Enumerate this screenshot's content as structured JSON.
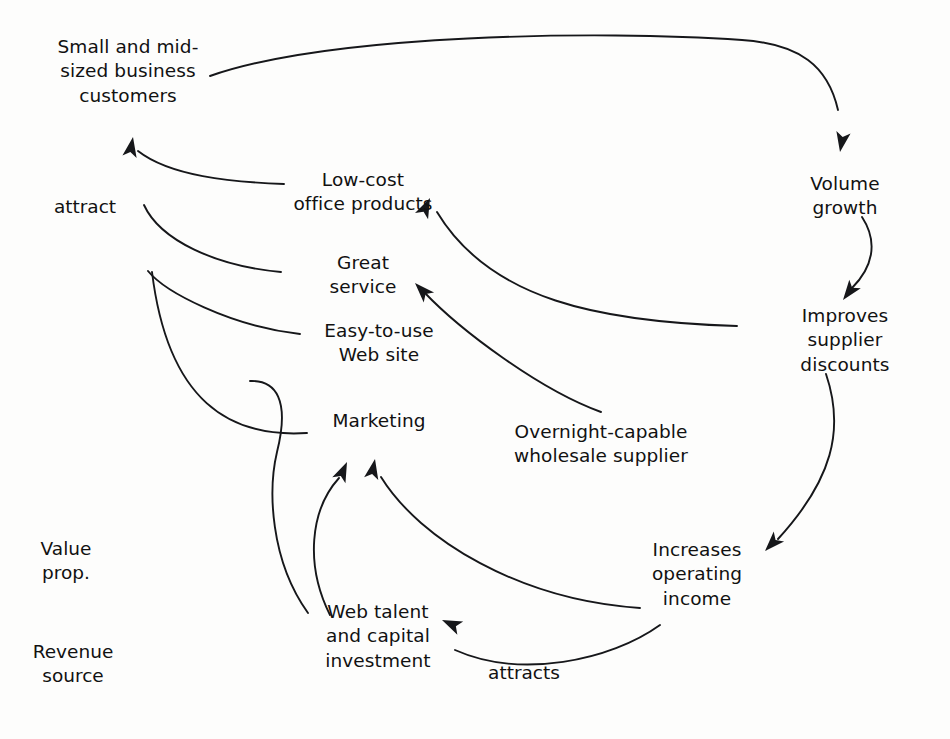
{
  "diagram": {
    "stroke_color": "#16171a",
    "text_color": "#111111",
    "background": "#fdfdfc",
    "nodes": [
      {
        "id": "customers",
        "label": "Small and mid-\nsized business\ncustomers",
        "x": 128,
        "y": 72
      },
      {
        "id": "low-cost-office-products",
        "label": "Low-cost\noffice products",
        "x": 363,
        "y": 192
      },
      {
        "id": "great-service",
        "label": "Great\nservice",
        "x": 363,
        "y": 275
      },
      {
        "id": "easy-to-use-web-site",
        "label": "Easy-to-use\nWeb site",
        "x": 379,
        "y": 343
      },
      {
        "id": "marketing",
        "label": "Marketing",
        "x": 379,
        "y": 421
      },
      {
        "id": "overnight-wholesale-supplier",
        "label": "Overnight-capable\nwholesale supplier",
        "x": 601,
        "y": 444
      },
      {
        "id": "web-talent-capital",
        "label": "Web talent\nand capital\ninvestment",
        "x": 378,
        "y": 637
      },
      {
        "id": "volume-growth",
        "label": "Volume growth",
        "x": 845,
        "y": 196
      },
      {
        "id": "improves-supplier-discounts",
        "label": "Improves\nsupplier discounts",
        "x": 845,
        "y": 341
      },
      {
        "id": "increases-operating-income",
        "label": "Increases\noperating\nincome",
        "x": 697,
        "y": 575
      }
    ],
    "edge_labels": [
      {
        "id": "attract",
        "label": "attract",
        "x": 85,
        "y": 207
      },
      {
        "id": "attracts",
        "label": "attracts",
        "x": 524,
        "y": 673
      }
    ],
    "column_labels": [
      {
        "id": "value-prop",
        "label": "Value\nprop.",
        "x": 66,
        "y": 561
      },
      {
        "id": "revenue-source",
        "label": "Revenue\nsource",
        "x": 73,
        "y": 664
      }
    ],
    "edges": [
      {
        "id": "customers-to-volume-growth",
        "from": "customers",
        "to": "volume-growth",
        "d": "M 210 76 C 330 34 600 30 742 40 C 800 44 828 66 838 110",
        "arrow": {
          "x": 840,
          "y": 152,
          "angle": 100
        }
      },
      {
        "id": "low-cost-to-customers",
        "from": "low-cost-office-products",
        "to": "customers",
        "d": "M 284 184 C 230 182 170 176 138 151",
        "arrow": null
      },
      {
        "id": "great-service-to-customers",
        "from": "great-service",
        "to": "customers",
        "d": "M 281 272 C 215 266 160 240 144 205",
        "arrow": null
      },
      {
        "id": "web-site-to-customers",
        "from": "easy-to-use-web-site",
        "to": "customers",
        "d": "M 300 334 C 230 326 165 292 148 271",
        "arrow": null
      },
      {
        "id": "marketing-to-customers",
        "from": "marketing",
        "to": "customers",
        "d": "M 307 433 C 230 438 168 402 152 272",
        "arrow": null
      },
      {
        "id": "attract-arrowhead",
        "from": "value-props",
        "to": "customers",
        "d": "",
        "arrow": {
          "x": 133,
          "y": 137,
          "angle": -80
        }
      },
      {
        "id": "volume-growth-to-supplier-discounts",
        "from": "volume-growth",
        "to": "improves-supplier-discounts",
        "d": "M 862 217 C 879 243 872 268 852 288",
        "arrow": {
          "x": 843,
          "y": 300,
          "angle": 127
        }
      },
      {
        "id": "supplier-discounts-to-low-cost",
        "from": "improves-supplier-discounts",
        "to": "low-cost-office-products",
        "d": "M 737 326 C 600 322 490 300 437 212",
        "arrow": {
          "x": 430,
          "y": 198,
          "angle": -65
        }
      },
      {
        "id": "overnight-supplier-to-great-service",
        "from": "overnight-wholesale-supplier",
        "to": "great-service",
        "d": "M 601 412 C 540 390 460 330 424 292",
        "arrow": {
          "x": 415,
          "y": 283,
          "angle": -134
        }
      },
      {
        "id": "supplier-discounts-to-operating-income",
        "from": "improves-supplier-discounts",
        "to": "increases-operating-income",
        "d": "M 826 374 C 845 430 832 480 778 539",
        "arrow": {
          "x": 765,
          "y": 551,
          "angle": 134
        }
      },
      {
        "id": "operating-income-to-marketing",
        "from": "increases-operating-income",
        "to": "marketing",
        "d": "M 640 608 C 520 600 420 540 381 477",
        "arrow": {
          "x": 375,
          "y": 459,
          "angle": -79
        }
      },
      {
        "id": "operating-income-to-web-talent",
        "from": "increases-operating-income",
        "to": "web-talent-capital",
        "d": "M 660 625 C 610 661 520 679 455 650",
        "arrow": {
          "x": 442,
          "y": 620,
          "angle": -156
        }
      },
      {
        "id": "web-talent-to-marketing",
        "from": "web-talent-capital",
        "to": "marketing",
        "d": "M 330 615 C 305 565 310 510 339 478",
        "arrow": {
          "x": 347,
          "y": 462,
          "angle": -66
        }
      },
      {
        "id": "web-talent-to-customers-long",
        "from": "web-talent-capital",
        "to": "customers",
        "d": "M 308 613 C 270 560 268 490 277 452 C 290 400 276 380 250 381",
        "arrow": null
      }
    ]
  }
}
